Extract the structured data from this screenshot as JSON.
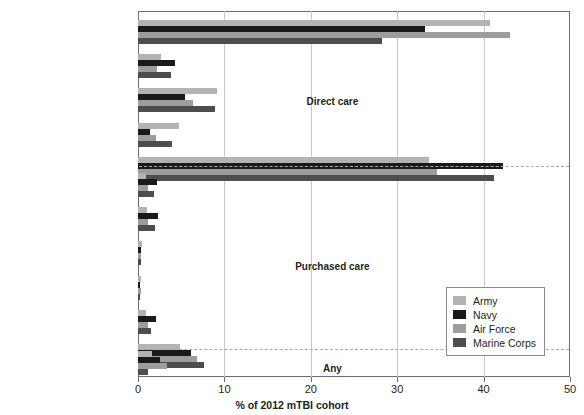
{
  "chart_data": {
    "type": "bar",
    "orientation": "horizontal",
    "title": "",
    "xlabel": "% of 2012 mTBI cohort",
    "ylabel": "",
    "xlim": [
      0,
      50
    ],
    "xticks": [
      0,
      10,
      20,
      30,
      40,
      50
    ],
    "grid": true,
    "legend_position": "lower-right",
    "series_names": [
      "Army",
      "Navy",
      "Air Force",
      "Marine Corps"
    ],
    "series_colors": [
      "#b3b3b3",
      "#1a1a1a",
      "#9d9d9d",
      "#4d4d4d"
    ],
    "sections": [
      {
        "name": "Direct care",
        "categories": [
          {
            "label": "Primary care*",
            "values": [
              40.7,
              33.2,
              43.1,
              28.2
            ]
          },
          {
            "label": "Emergency department*",
            "values": [
              2.7,
              4.3,
              2.2,
              3.8
            ]
          },
          {
            "label": "Behavioral health*",
            "values": [
              9.2,
              5.4,
              6.4,
              8.9
            ]
          },
          {
            "label": "Neurology*",
            "values": [
              4.7,
              1.4,
              2.1,
              3.9
            ]
          },
          {
            "label": "Other*",
            "values": [
              33.7,
              42.2,
              34.6,
              41.2
            ]
          }
        ]
      },
      {
        "name": "Purchased care",
        "categories": [
          {
            "label": "Primary care*",
            "values": [
              0.9,
              2.2,
              1.1,
              1.9
            ]
          },
          {
            "label": "Emergency department*",
            "values": [
              1.0,
              2.3,
              1.1,
              2.0
            ]
          },
          {
            "label": "Behavioral health*",
            "values": [
              0.5,
              0.3,
              0.4,
              0.3
            ]
          },
          {
            "label": "Neurology",
            "values": [
              0.3,
              0.2,
              0.3,
              0.2
            ]
          },
          {
            "label": "Inpatient*",
            "values": [
              0.9,
              2.1,
              1.1,
              1.5
            ]
          },
          {
            "label": "Other*",
            "values": [
              4.9,
              6.1,
              6.8,
              7.6
            ]
          }
        ]
      },
      {
        "name": "Any",
        "categories": [
          {
            "label": "Other*",
            "values": [
              1.6,
              2.6,
              3.3,
              1.1
            ]
          }
        ]
      }
    ]
  },
  "legend": {
    "items": [
      {
        "label": "Army",
        "color": "#b3b3b3"
      },
      {
        "label": "Navy",
        "color": "#1a1a1a"
      },
      {
        "label": "Air Force",
        "color": "#9d9d9d"
      },
      {
        "label": "Marine Corps",
        "color": "#4d4d4d"
      }
    ]
  },
  "axis": {
    "x_title": "% of 2012 mTBI cohort",
    "tick_labels": [
      "0",
      "10",
      "20",
      "30",
      "40",
      "50"
    ]
  },
  "section_labels": [
    "Direct care",
    "Purchased care",
    "Any"
  ]
}
